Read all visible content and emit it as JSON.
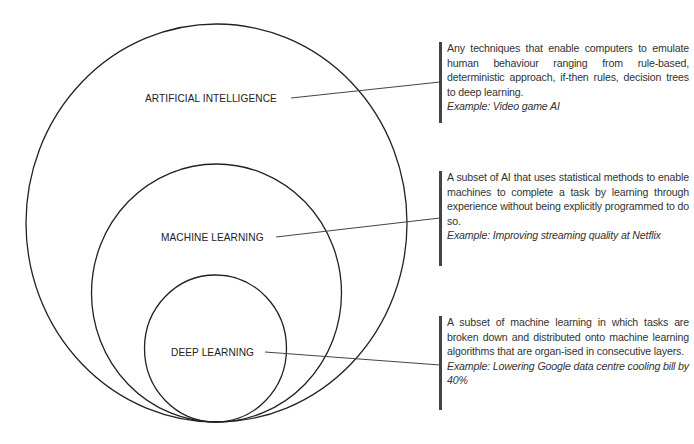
{
  "diagram": {
    "type": "nested-circles",
    "circles": [
      {
        "id": "ai",
        "label": "ARTIFICIAL INTELLIGENCE",
        "description": "Any techniques that enable computers to emulate human behaviour ranging from rule-based, deterministic approach, if-then rules, decision trees to deep learning.",
        "example_label": "Example:",
        "example_text": "Video game AI"
      },
      {
        "id": "ml",
        "label": "MACHINE LEARNING",
        "description": "A subset of AI that uses statistical methods to enable machines to complete a task by learning through experience without being explicitly programmed to do so.",
        "example_label": "Example:",
        "example_text": "Improving streaming quality at Netflix"
      },
      {
        "id": "dl",
        "label": "DEEP LEARNING",
        "description": "A subset of machine learning in which tasks are broken down and distributed onto machine learning algorithms that are organ-ised in consecutive layers.",
        "example_label": "Example:",
        "example_text": "Lowering Google data centre cooling bill by 40%"
      }
    ],
    "colors": {
      "stroke": "#222222",
      "text": "#222222",
      "background": "#ffffff"
    }
  }
}
